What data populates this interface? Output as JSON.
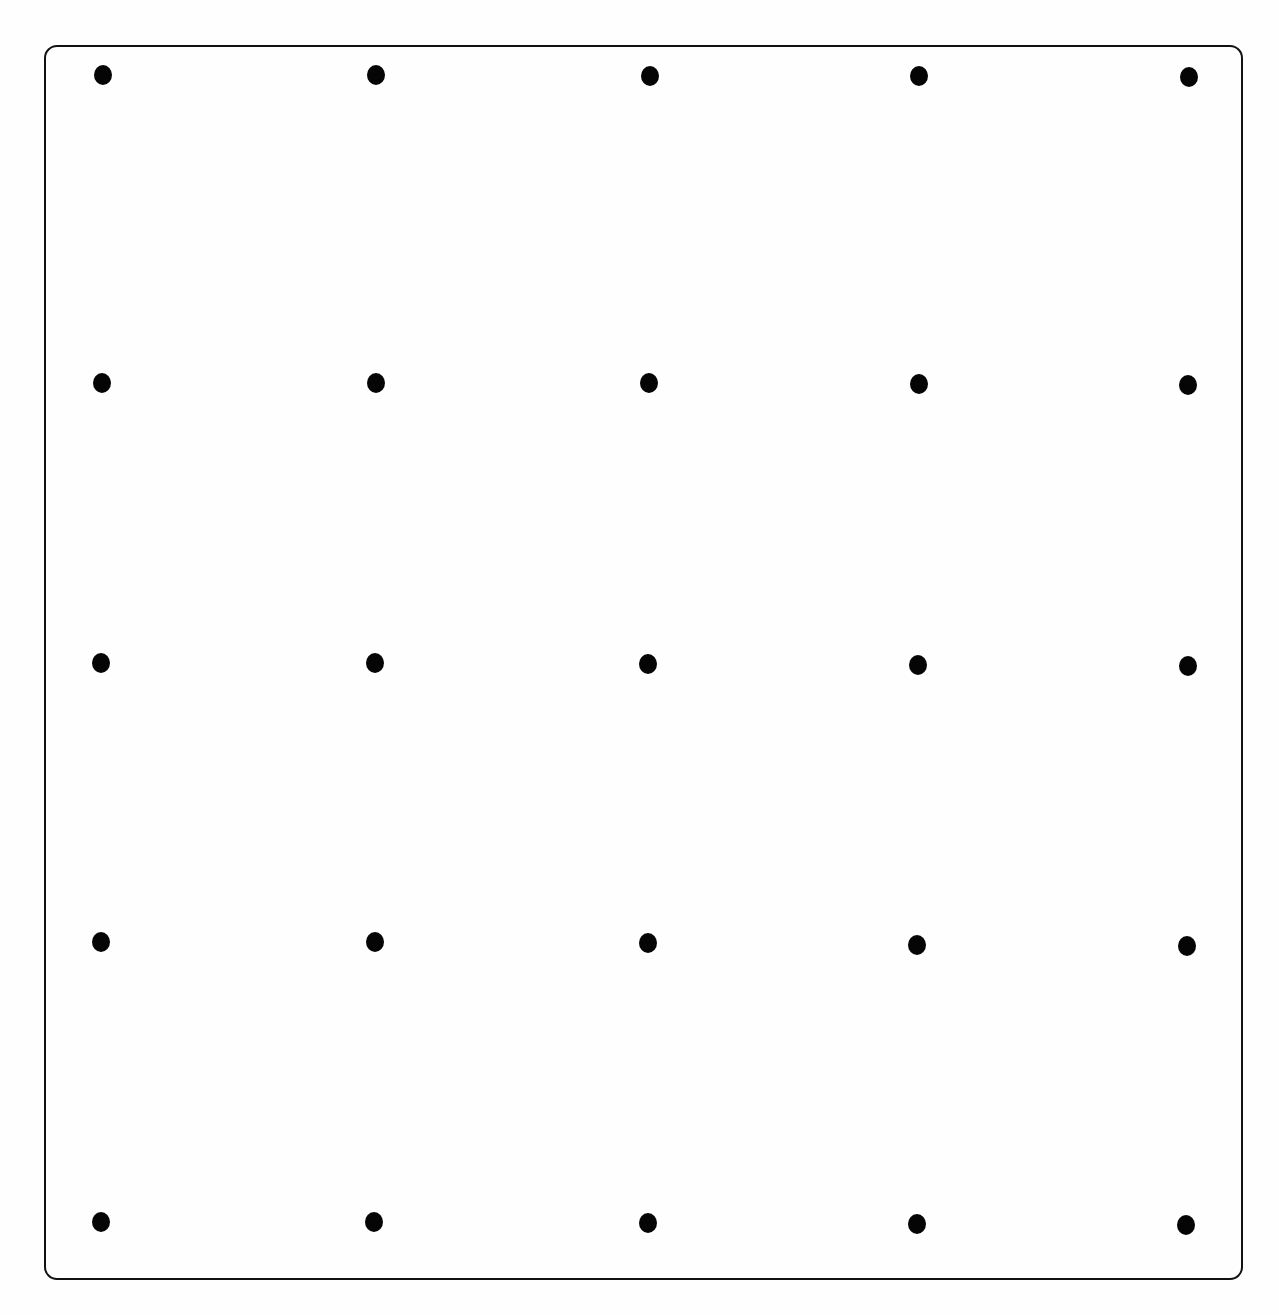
{
  "diagram": {
    "type": "dot-grid",
    "rows": 5,
    "columns": 5,
    "colors": {
      "background": "#fefefe",
      "frame_border": "#111111",
      "dot": "#050505"
    },
    "frame": {
      "left": 44,
      "top": 45,
      "width": 1199,
      "height": 1235,
      "radius": 13
    },
    "column_x": [
      103,
      376,
      650,
      918,
      1188
    ],
    "row_y": [
      75,
      383,
      664,
      943,
      1222
    ],
    "dots": [
      {
        "row": 1,
        "col": 1,
        "x": 103,
        "y": 75
      },
      {
        "row": 1,
        "col": 2,
        "x": 376,
        "y": 75
      },
      {
        "row": 1,
        "col": 3,
        "x": 650,
        "y": 76
      },
      {
        "row": 1,
        "col": 4,
        "x": 919,
        "y": 76
      },
      {
        "row": 1,
        "col": 5,
        "x": 1189,
        "y": 77
      },
      {
        "row": 2,
        "col": 1,
        "x": 102,
        "y": 383
      },
      {
        "row": 2,
        "col": 2,
        "x": 376,
        "y": 383
      },
      {
        "row": 2,
        "col": 3,
        "x": 649,
        "y": 383
      },
      {
        "row": 2,
        "col": 4,
        "x": 919,
        "y": 384
      },
      {
        "row": 2,
        "col": 5,
        "x": 1188,
        "y": 385
      },
      {
        "row": 3,
        "col": 1,
        "x": 101,
        "y": 663
      },
      {
        "row": 3,
        "col": 2,
        "x": 375,
        "y": 663
      },
      {
        "row": 3,
        "col": 3,
        "x": 648,
        "y": 664
      },
      {
        "row": 3,
        "col": 4,
        "x": 918,
        "y": 665
      },
      {
        "row": 3,
        "col": 5,
        "x": 1188,
        "y": 666
      },
      {
        "row": 4,
        "col": 1,
        "x": 101,
        "y": 942
      },
      {
        "row": 4,
        "col": 2,
        "x": 375,
        "y": 942
      },
      {
        "row": 4,
        "col": 3,
        "x": 648,
        "y": 943
      },
      {
        "row": 4,
        "col": 4,
        "x": 917,
        "y": 945
      },
      {
        "row": 4,
        "col": 5,
        "x": 1187,
        "y": 946
      },
      {
        "row": 5,
        "col": 1,
        "x": 101,
        "y": 1222
      },
      {
        "row": 5,
        "col": 2,
        "x": 374,
        "y": 1222
      },
      {
        "row": 5,
        "col": 3,
        "x": 648,
        "y": 1223
      },
      {
        "row": 5,
        "col": 4,
        "x": 917,
        "y": 1224
      },
      {
        "row": 5,
        "col": 5,
        "x": 1186,
        "y": 1225
      }
    ]
  }
}
